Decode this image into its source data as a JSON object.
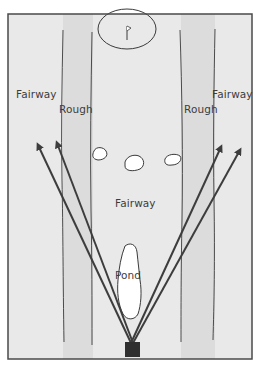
{
  "diagram": {
    "type": "golf-hole-layout",
    "colors": {
      "background": "#e9e9e9",
      "rough": "#dcdcdc",
      "frame": "#4a4a4a",
      "outline": "#3a3a3a",
      "arrow": "#3d3d3d",
      "tee": "#2f2f2f",
      "hazard_fill": "#ffffff",
      "text": "#3c3c3c"
    },
    "labels": {
      "fairway_left": "Fairway",
      "rough_left": "Rough",
      "rough_right": "Rough",
      "fairway_right": "Fairway",
      "fairway_center": "Fairway",
      "pond": "Pond"
    },
    "elements": {
      "green": "Green with flag",
      "flag": "flag-icon",
      "tee_box": "Tee box",
      "sand_traps": [
        "Bunker 1",
        "Bunker 2",
        "Bunker 3"
      ],
      "shot_arrows": [
        {
          "name": "shot-far-left",
          "from": [
            132,
            342
          ],
          "to": [
            37,
            143
          ]
        },
        {
          "name": "shot-left",
          "from": [
            132,
            342
          ],
          "to": [
            56,
            141
          ]
        },
        {
          "name": "shot-right",
          "from": [
            132,
            342
          ],
          "to": [
            222,
            145
          ]
        },
        {
          "name": "shot-far-right",
          "from": [
            132,
            342
          ],
          "to": [
            241,
            148
          ]
        }
      ]
    }
  }
}
